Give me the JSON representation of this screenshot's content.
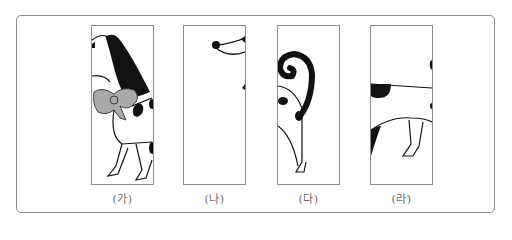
{
  "figure": {
    "panels": [
      {
        "id": "ga",
        "label": "(가)",
        "content": "dog head with black ear and gray bow, front legs"
      },
      {
        "id": "na",
        "label": "(나)",
        "content": "dog nose tip and mouth line"
      },
      {
        "id": "da",
        "label": "(다)",
        "content": "curled black tail, rear with spots, hind leg"
      },
      {
        "id": "ra",
        "label": "(라)",
        "content": "back line with spot, belly, spots and hind leg"
      }
    ],
    "colors": {
      "frame": "#8a8a8a",
      "panel_border": "#8c8c8c",
      "ink": "#111111",
      "bow": "#a9a9a9",
      "label": "#6a6a6a"
    }
  }
}
